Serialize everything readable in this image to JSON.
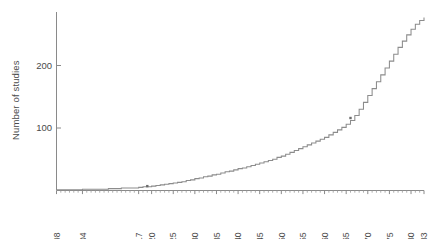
{
  "chart_data": {
    "type": "line",
    "title": "",
    "subtitle": "",
    "xlabel": "",
    "ylabel": "Number of studies",
    "xlim": [
      1898,
      1983
    ],
    "ylim": [
      0,
      290
    ],
    "grid": false,
    "legend": null,
    "y_ticks": [
      100,
      200
    ],
    "y_tick_labels": [
      "100",
      "200"
    ],
    "x_ticks": [
      1898,
      1904,
      1917,
      1920,
      1925,
      1930,
      1935,
      1940,
      1945,
      1950,
      1955,
      1960,
      1965,
      1970,
      1975,
      1980,
      1983
    ],
    "x_tick_labels": [
      "1898",
      "1904",
      "1917",
      "1920",
      "1925",
      "1930",
      "1935",
      "1940",
      "1945",
      "1950",
      "1955",
      "1960",
      "1965",
      "1970",
      "1975",
      "1980",
      "1983"
    ],
    "x_tick_rotation": 90,
    "series": [
      {
        "name": "Cumulative number of studies",
        "style": "step",
        "color": "#8c8c8c",
        "x": [
          1898,
          1904,
          1910,
          1913,
          1917,
          1918,
          1920,
          1921,
          1922,
          1923,
          1924,
          1925,
          1926,
          1927,
          1928,
          1929,
          1930,
          1931,
          1932,
          1933,
          1934,
          1935,
          1936,
          1937,
          1938,
          1939,
          1940,
          1941,
          1942,
          1943,
          1944,
          1945,
          1946,
          1947,
          1948,
          1949,
          1950,
          1951,
          1952,
          1953,
          1954,
          1955,
          1956,
          1957,
          1958,
          1959,
          1960,
          1961,
          1962,
          1963,
          1964,
          1965,
          1966,
          1967,
          1968,
          1969,
          1970,
          1971,
          1972,
          1973,
          1974,
          1975,
          1976,
          1977,
          1978,
          1979,
          1980,
          1981,
          1982,
          1983
        ],
        "y": [
          1,
          2,
          3,
          4,
          5,
          6,
          7,
          8,
          9,
          10,
          11,
          12,
          13,
          14,
          16,
          17,
          19,
          20,
          22,
          23,
          25,
          26,
          28,
          30,
          31,
          33,
          35,
          36,
          38,
          40,
          42,
          44,
          46,
          48,
          50,
          53,
          55,
          58,
          61,
          64,
          67,
          70,
          73,
          76,
          79,
          82,
          85,
          89,
          93,
          97,
          101,
          106,
          112,
          120,
          130,
          141,
          152,
          163,
          174,
          185,
          196,
          207,
          218,
          229,
          239,
          249,
          258,
          266,
          272,
          277
        ]
      }
    ],
    "markers": [
      {
        "x": 1919,
        "y": 7,
        "label": ""
      },
      {
        "x": 1966,
        "y": 116,
        "label": ""
      }
    ]
  },
  "axes": {
    "y_axis_name": "y-axis",
    "x_axis_name": "x-axis"
  }
}
